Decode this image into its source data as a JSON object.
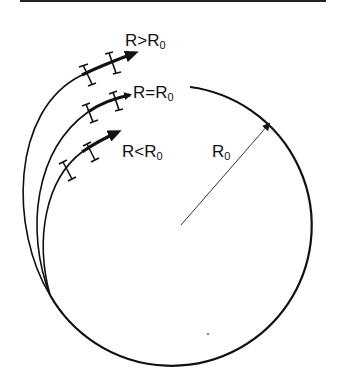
{
  "figure": {
    "labels": {
      "greater": "R>R",
      "equal": "R=R",
      "less": "R<R",
      "radius": "R",
      "subscript": "0"
    },
    "elements": [
      "circle-of-radius-R0",
      "radius-arrow",
      "trajectory-R-greater-R0",
      "trajectory-R-equal-R0",
      "trajectory-R-less-R0"
    ],
    "colors": {
      "stroke": "#111111",
      "background": "#ffffff"
    }
  }
}
